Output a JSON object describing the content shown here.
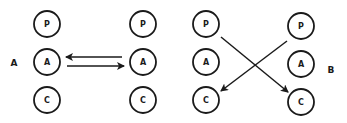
{
  "panels": [
    {
      "label": "A",
      "columns": [
        [
          "P",
          "A",
          "C"
        ],
        [
          "P",
          "A",
          "C"
        ]
      ],
      "arrows": [
        {
          "from": "right-A",
          "to": "left-A",
          "description": "arrow from right A to left A"
        },
        {
          "from": "left-A",
          "to": "right-A",
          "description": "arrow from left A to right A"
        }
      ]
    },
    {
      "label": "B",
      "columns": [
        [
          "P",
          "A",
          "C"
        ],
        [
          "P",
          "A",
          "C"
        ]
      ],
      "arrows": [
        {
          "from": "left-P",
          "to": "right-C",
          "description": "arrow from left P to right C"
        },
        {
          "from": "right-P",
          "to": "left-C",
          "description": "arrow from right P to left C"
        }
      ]
    }
  ]
}
